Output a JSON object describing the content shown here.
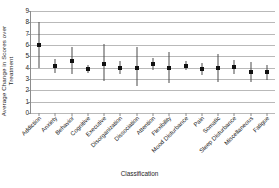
{
  "chart_data": {
    "type": "scatter",
    "title": "",
    "xlabel": "Classification",
    "ylabel": "Average Change in Scores over\nTreatment",
    "ylim": [
      0,
      9
    ],
    "yticks": [
      0,
      1,
      2,
      3,
      4,
      5,
      6,
      7,
      8,
      9
    ],
    "grid": true,
    "legend": "none",
    "error_bars": "vertical",
    "categories": [
      "Addiction",
      "Anxiety",
      "Behavior",
      "Cognitive",
      "Executive",
      "Disorganization",
      "Dissociation",
      "Attention",
      "Flexibility",
      "Mood Disturbance",
      "Pain",
      "Somatic",
      "Sleep Disturbance",
      "Miscellaneous",
      "Fatigue"
    ],
    "values": [
      6.0,
      4.15,
      4.6,
      3.85,
      4.35,
      4.0,
      4.0,
      4.3,
      4.0,
      4.15,
      3.85,
      4.0,
      4.05,
      3.65,
      3.6
    ],
    "lower": [
      4.0,
      3.5,
      3.4,
      3.5,
      2.85,
      3.45,
      2.35,
      3.8,
      2.65,
      3.75,
      3.35,
      2.75,
      3.45,
      2.75,
      2.95
    ],
    "upper": [
      8.0,
      4.8,
      5.85,
      4.2,
      6.05,
      4.6,
      5.8,
      4.85,
      5.4,
      4.6,
      4.45,
      5.25,
      4.7,
      4.5,
      4.25
    ]
  }
}
